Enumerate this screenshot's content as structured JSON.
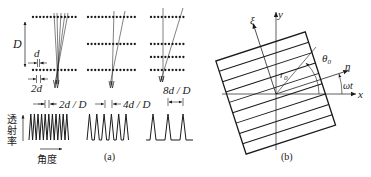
{
  "panel_a": {
    "caption": "(a)",
    "labels": {
      "D": "D",
      "d": "d",
      "two_d": "2d",
      "period_1": "2d / D",
      "period_2": "4d / D",
      "period_3": "8d / D",
      "y_axis": "透射率",
      "x_axis": "角度"
    },
    "groups": [
      {
        "name": "grating-set-1",
        "rows": 2,
        "period_label": "2d / D",
        "peaks": 11
      },
      {
        "name": "grating-set-2",
        "rows": 3,
        "period_label": "4d / D",
        "peaks": 6
      },
      {
        "name": "grating-set-3",
        "rows": 4,
        "period_label": "8d / D",
        "peaks": 3
      }
    ]
  },
  "panel_b": {
    "caption": "(b)",
    "labels": {
      "x": "x",
      "y": "y",
      "xi": "ξ",
      "eta": "η",
      "theta0": "θ",
      "theta0_sub": "0",
      "r0": "r",
      "r0_sub": "0",
      "omega_t": "ωt"
    },
    "grid_lines": 8
  },
  "colors": {
    "ink": "#1a1a1a",
    "background": "#ffffff"
  }
}
